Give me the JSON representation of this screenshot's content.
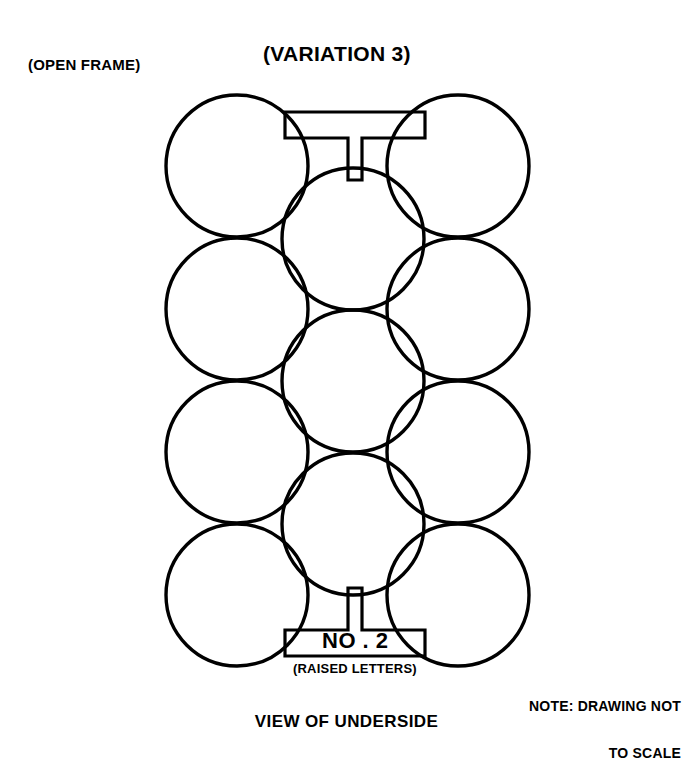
{
  "drawing": {
    "open_frame_label": "(OPEN FRAME)",
    "variation_label": "(VARIATION 3)",
    "part_number_label": "NO . 2",
    "raised_letters_label": "(RAISED LETTERS)",
    "note_line_1": "NOTE: DRAWING NOT",
    "note_line_2": "TO SCALE",
    "view_caption": "VIEW OF UNDERSIDE",
    "line_color": "#000000",
    "background_color": "#ffffff",
    "geometry": {
      "circle_radius": 71,
      "column_centers_x": [
        237,
        353,
        458
      ],
      "outer_column_centers_y": [
        166,
        309,
        452,
        595
      ],
      "center_column_centers_y": [
        239,
        381,
        524
      ],
      "circle_count": 11,
      "frame_top_bar_y": 112,
      "frame_bottom_bar_y": 656
    }
  }
}
